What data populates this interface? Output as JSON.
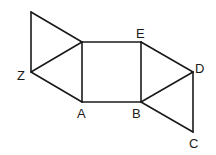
{
  "diagram": {
    "title": "",
    "vertices": {
      "P": {
        "x": 31,
        "y": 12,
        "label": ""
      },
      "Q": {
        "x": 82,
        "y": 42,
        "label": ""
      },
      "Z": {
        "x": 31,
        "y": 72,
        "label": "Z"
      },
      "A": {
        "x": 82,
        "y": 102,
        "label": "A"
      },
      "E": {
        "x": 141,
        "y": 42,
        "label": "E"
      },
      "B": {
        "x": 141,
        "y": 102,
        "label": "B"
      },
      "D": {
        "x": 193,
        "y": 72,
        "label": "D"
      },
      "C": {
        "x": 193,
        "y": 132,
        "label": "C"
      }
    },
    "edges": [
      [
        "P",
        "Q"
      ],
      [
        "P",
        "Z"
      ],
      [
        "Z",
        "Q"
      ],
      [
        "Z",
        "A"
      ],
      [
        "Q",
        "A"
      ],
      [
        "Q",
        "E"
      ],
      [
        "A",
        "B"
      ],
      [
        "E",
        "B"
      ],
      [
        "E",
        "D"
      ],
      [
        "B",
        "D"
      ],
      [
        "B",
        "C"
      ],
      [
        "D",
        "C"
      ]
    ],
    "labels": {
      "Z": "Z",
      "A": "A",
      "E": "E",
      "B": "B",
      "D": "D",
      "C": "C"
    }
  }
}
